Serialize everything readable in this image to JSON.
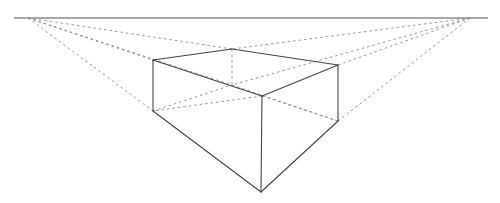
{
  "diagram": {
    "colors": {
      "background": "#ffffff",
      "solid_edge": "#444444",
      "guide_line": "#8a8a8a",
      "horizon": "#555555"
    },
    "horizon": {
      "x1": 14,
      "y1": 18,
      "x2": 488,
      "y2": 18
    },
    "vanishing_points": {
      "left": {
        "x": 28,
        "y": 18
      },
      "right": {
        "x": 470,
        "y": 18
      }
    },
    "vertices": {
      "top_left": {
        "x": 153,
        "y": 60
      },
      "top_back": {
        "x": 232,
        "y": 49
      },
      "top_right": {
        "x": 338,
        "y": 65
      },
      "top_front": {
        "x": 262,
        "y": 96
      },
      "bottom_left": {
        "x": 153,
        "y": 111
      },
      "bottom_back": {
        "x": 232,
        "y": 85
      },
      "bottom_right": {
        "x": 338,
        "y": 121
      },
      "bottom_front": {
        "x": 261,
        "y": 192
      }
    }
  }
}
